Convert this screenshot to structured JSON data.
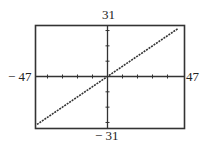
{
  "chart_data": {
    "type": "line",
    "title": "",
    "xlabel": "",
    "ylabel": "",
    "xlim": [
      -47,
      47
    ],
    "ylim": [
      -31,
      31
    ],
    "x_tick_step": 10,
    "y_tick_step": 10,
    "grid": false,
    "legend": "none",
    "window_labels": {
      "xmin": "− 47",
      "xmax": "47",
      "ymin": "− 31",
      "ymax": "31"
    },
    "series": [
      {
        "name": "y = (2/3)x",
        "x": [
          -47,
          47
        ],
        "y": [
          -31.3,
          31.3
        ]
      }
    ]
  }
}
